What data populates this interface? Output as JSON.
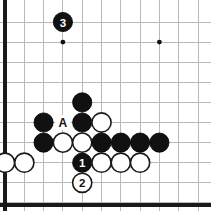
{
  "diagram": {
    "type": "go-board-diagram",
    "board": {
      "visible_columns": 11,
      "visible_rows": 10,
      "origin_x": 5,
      "origin_y": 22,
      "column_spacing": 19.3,
      "row_spacing": 20.1,
      "stone_radius": 9.6,
      "grid_color": "#b9b9b9",
      "edge_color": "#1a1a1a",
      "background_color": "#ffffff",
      "edges": [
        "left",
        "bottom"
      ]
    },
    "star_points": [
      {
        "col": 3,
        "row": 1
      },
      {
        "col": 8,
        "row": 1
      },
      {
        "col": 8,
        "row": 6
      }
    ],
    "stones": [
      {
        "col": 3,
        "row": 0,
        "color": "black",
        "label": "3",
        "move_number": 3
      },
      {
        "col": 4,
        "row": 4,
        "color": "black",
        "label": ""
      },
      {
        "col": 2,
        "row": 5,
        "color": "black",
        "label": ""
      },
      {
        "col": 4,
        "row": 5,
        "color": "black",
        "label": ""
      },
      {
        "col": 5,
        "row": 5,
        "color": "white",
        "label": ""
      },
      {
        "col": 2,
        "row": 6,
        "color": "black",
        "label": ""
      },
      {
        "col": 3,
        "row": 6,
        "color": "white",
        "label": ""
      },
      {
        "col": 4,
        "row": 6,
        "color": "white",
        "label": ""
      },
      {
        "col": 5,
        "row": 6,
        "color": "black",
        "label": ""
      },
      {
        "col": 6,
        "row": 6,
        "color": "black",
        "label": ""
      },
      {
        "col": 7,
        "row": 6,
        "color": "black",
        "label": ""
      },
      {
        "col": 8,
        "row": 6,
        "color": "black",
        "label": ""
      },
      {
        "col": 0,
        "row": 7,
        "color": "white",
        "label": ""
      },
      {
        "col": 1,
        "row": 7,
        "color": "white",
        "label": ""
      },
      {
        "col": 4,
        "row": 7,
        "color": "black",
        "label": "1",
        "move_number": 1
      },
      {
        "col": 5,
        "row": 7,
        "color": "white",
        "label": ""
      },
      {
        "col": 6,
        "row": 7,
        "color": "white",
        "label": ""
      },
      {
        "col": 7,
        "row": 7,
        "color": "white",
        "label": ""
      },
      {
        "col": 4,
        "row": 8,
        "color": "white",
        "label": "2",
        "move_number": 2
      }
    ],
    "point_labels": [
      {
        "col": 3,
        "row": 5,
        "text": "A"
      }
    ]
  }
}
